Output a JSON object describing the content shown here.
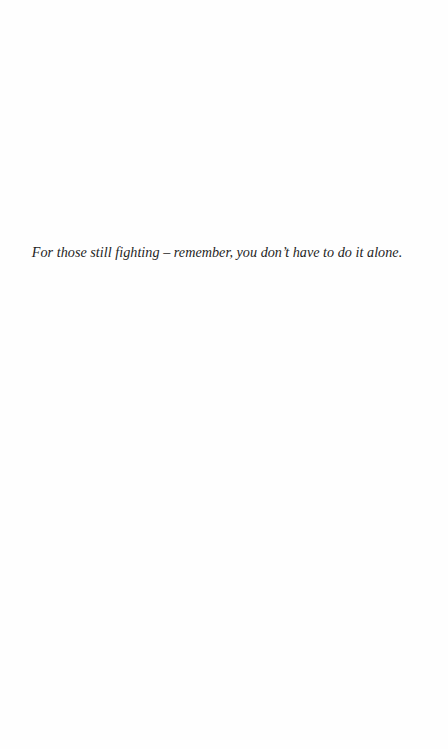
{
  "page": {
    "type": "dedication",
    "background_color": "#fefefe",
    "text_color": "#1e1e1e"
  },
  "dedication": {
    "text": "For those still fighting – remember, you don’t have to do it alone."
  }
}
